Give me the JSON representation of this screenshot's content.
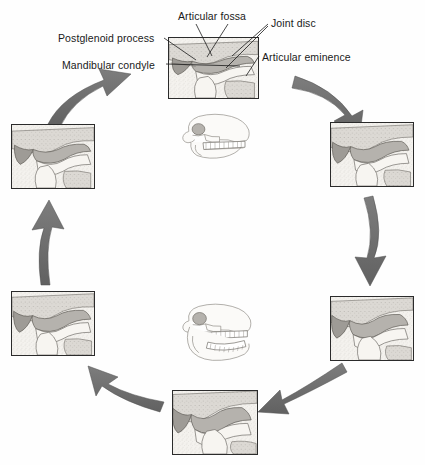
{
  "figure": {
    "kind": "anatomical-diagram",
    "background_color": "#ffffff",
    "arrow_color": "#6e6e6e",
    "bone_fill": "#f2f0ec",
    "disc_fill": "#a8a8a8",
    "panel_bg": "#e9e9e7",
    "panel_border": "#2b2b2b"
  },
  "labels": [
    {
      "id": "articular-fossa",
      "text": "Articular fossa",
      "x": 178,
      "y": 11
    },
    {
      "id": "joint-disc",
      "text": "Joint disc",
      "x": 271,
      "y": 18
    },
    {
      "id": "postglenoid-process",
      "text": "Postglenoid process",
      "x": 58,
      "y": 33
    },
    {
      "id": "articular-eminence",
      "text": "Articular eminence",
      "x": 262,
      "y": 52
    },
    {
      "id": "mandibular-condyle",
      "text": "Mandibular condyle",
      "x": 62,
      "y": 60
    }
  ],
  "leader_lines": [
    {
      "for": "articular-fossa",
      "x1": 196,
      "y1": 24,
      "x2": 212,
      "y2": 56
    },
    {
      "for": "articular-fossa",
      "x1": 228,
      "y1": 24,
      "x2": 207,
      "y2": 57
    },
    {
      "for": "joint-disc",
      "x1": 268,
      "y1": 24,
      "x2": 232,
      "y2": 56
    },
    {
      "for": "joint-disc",
      "x1": 268,
      "y1": 26,
      "x2": 226,
      "y2": 68
    },
    {
      "for": "postglenoid-process",
      "x1": 164,
      "y1": 38,
      "x2": 196,
      "y2": 60
    },
    {
      "for": "mandibular-condyle",
      "x1": 166,
      "y1": 64,
      "x2": 240,
      "y2": 66
    },
    {
      "for": "articular-eminence",
      "x1": 259,
      "y1": 56,
      "x2": 246,
      "y2": 76
    }
  ],
  "panels": [
    {
      "id": "panel-top-center",
      "position": "top-center",
      "stage": 1,
      "caption": "Closed / rest position",
      "x": 168,
      "y": 37,
      "w": 91,
      "h": 62
    },
    {
      "id": "panel-right-upper",
      "position": "right-upper",
      "stage": 2,
      "caption": "Early rotation",
      "x": 330,
      "y": 122,
      "w": 84,
      "h": 65
    },
    {
      "id": "panel-right-lower",
      "position": "right-lower",
      "stage": 3,
      "caption": "Condyle translating forward",
      "x": 330,
      "y": 296,
      "w": 84,
      "h": 65
    },
    {
      "id": "panel-bottom-center",
      "position": "bottom-center",
      "stage": 4,
      "caption": "Maximum opening",
      "x": 172,
      "y": 390,
      "w": 86,
      "h": 65
    },
    {
      "id": "panel-left-lower",
      "position": "left-lower",
      "stage": 5,
      "caption": "Beginning closure",
      "x": 11,
      "y": 291,
      "w": 84,
      "h": 65
    },
    {
      "id": "panel-left-upper",
      "position": "left-upper",
      "stage": 6,
      "caption": "Condyle returning to fossa",
      "x": 11,
      "y": 124,
      "w": 84,
      "h": 65
    }
  ],
  "skulls": [
    {
      "id": "skull-closed",
      "caption": "Closed mouth",
      "x": 176,
      "y": 112,
      "w": 78,
      "h": 48
    },
    {
      "id": "skull-open",
      "caption": "Open mouth",
      "x": 176,
      "y": 302,
      "w": 82,
      "h": 62
    }
  ],
  "arrows": [
    {
      "id": "arrow-top-left-to-top",
      "from": "panel-left-upper",
      "to": "panel-top-center",
      "direction": "up-right"
    },
    {
      "id": "arrow-top-to-right-upper",
      "from": "panel-top-center",
      "to": "panel-right-upper",
      "direction": "down-right"
    },
    {
      "id": "arrow-right-down",
      "from": "panel-right-upper",
      "to": "panel-right-lower",
      "direction": "down"
    },
    {
      "id": "arrow-right-lower-to-bottom",
      "from": "panel-right-lower",
      "to": "panel-bottom-center",
      "direction": "down-left"
    },
    {
      "id": "arrow-bottom-to-left-lower",
      "from": "panel-bottom-center",
      "to": "panel-left-lower",
      "direction": "up-left"
    },
    {
      "id": "arrow-left-up",
      "from": "panel-left-lower",
      "to": "panel-left-upper",
      "direction": "up"
    }
  ]
}
